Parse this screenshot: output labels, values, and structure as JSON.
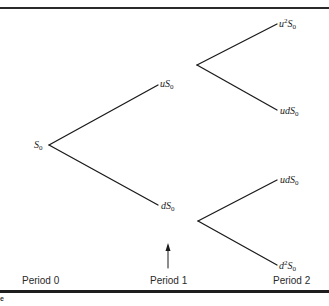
{
  "diagram": {
    "type": "binomial-tree",
    "stroke_color": "#1a1a1a",
    "nodes": [
      {
        "id": "root",
        "base": "S",
        "sub": "0",
        "prefix": "",
        "sup": "",
        "period": 0
      },
      {
        "id": "up",
        "prefix": "u",
        "sup": "",
        "base": "S",
        "sub": "0",
        "period": 1
      },
      {
        "id": "down",
        "prefix": "d",
        "sup": "",
        "base": "S",
        "sub": "0",
        "period": 1
      },
      {
        "id": "upup",
        "prefix": "u",
        "sup": "2",
        "base": "S",
        "sub": "0",
        "period": 2
      },
      {
        "id": "updown",
        "prefix": "ud",
        "sup": "",
        "base": "S",
        "sub": "0",
        "period": 2
      },
      {
        "id": "downup",
        "prefix": "ud",
        "sup": "",
        "base": "S",
        "sub": "0",
        "period": 2
      },
      {
        "id": "downdown",
        "prefix": "d",
        "sup": "2",
        "base": "S",
        "sub": "0",
        "period": 2
      }
    ],
    "edges": [
      {
        "from": "root",
        "to": "up"
      },
      {
        "from": "root",
        "to": "down"
      },
      {
        "from": "up",
        "to": "upup"
      },
      {
        "from": "up",
        "to": "updown"
      },
      {
        "from": "down",
        "to": "downup"
      },
      {
        "from": "down",
        "to": "downdown"
      }
    ],
    "periods": [
      "Period 0",
      "Period 1",
      "Period 2"
    ],
    "arrow_marker": "Period 1",
    "footer_fragment": "e"
  }
}
